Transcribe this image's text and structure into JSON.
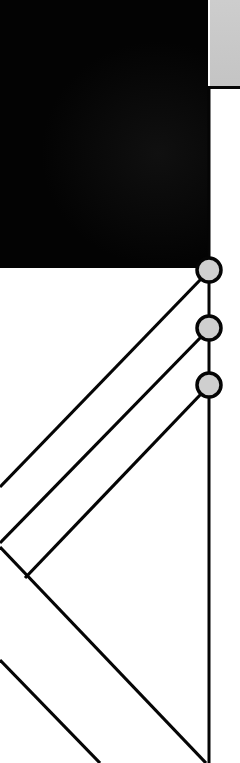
{
  "canvas": {
    "width": 240,
    "height": 763,
    "background": "#ffffff"
  },
  "colors": {
    "dark_block": "#030303",
    "gray_panel": "#c8c8c8",
    "stroke": "#050505",
    "node_fill": "#cfcfcf"
  },
  "dark_block": {
    "x": 0,
    "y": 0,
    "w": 208,
    "h": 268
  },
  "gray_panel": {
    "x": 210,
    "y": 0,
    "w": 30,
    "h": 86
  },
  "vertical_line": {
    "x": 209,
    "y1": 86,
    "y2": 763,
    "stroke_width": 3
  },
  "nodes": [
    {
      "cx": 209,
      "cy": 270,
      "r": 12
    },
    {
      "cx": 209,
      "cy": 328,
      "r": 12
    },
    {
      "cx": 209,
      "cy": 385,
      "r": 12
    }
  ],
  "diagonals": [
    {
      "x1": 201,
      "y1": 279,
      "x2": 0,
      "y2": 487
    },
    {
      "x1": 201,
      "y1": 337,
      "x2": 0,
      "y2": 543
    },
    {
      "x1": 201,
      "y1": 394,
      "x2": 25,
      "y2": 578
    },
    {
      "x1": 0,
      "y1": 547,
      "x2": 206,
      "y2": 763
    },
    {
      "x1": 0,
      "y1": 660,
      "x2": 100,
      "y2": 763
    }
  ],
  "stroke_width": 3.2
}
